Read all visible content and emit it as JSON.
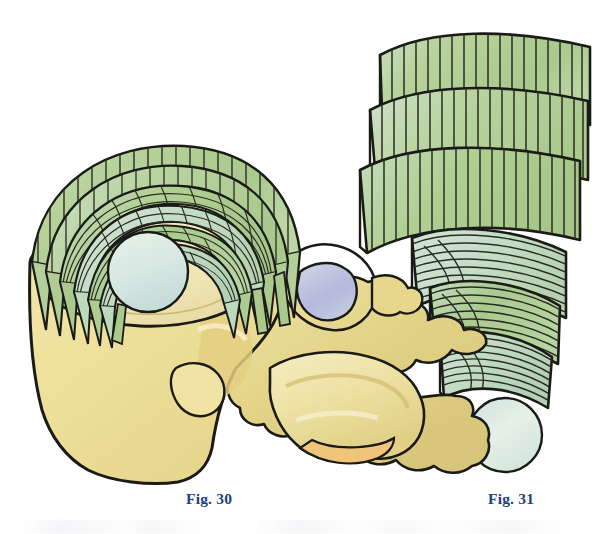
{
  "plate": {
    "background_color": "#ffffff",
    "width": 611,
    "height": 534,
    "subject": "intervertebral disc annulus fibrosus lamellae and vertebra"
  },
  "captions": {
    "fig30": "Fig. 30",
    "fig31": "Fig. 31",
    "color": "#1f3f7f"
  },
  "palette": {
    "outline": "#1a1a16",
    "lamella_green_light": "#c3d8a8",
    "lamella_green_mid": "#aecb92",
    "lamella_green_pale": "#cfe0c4",
    "lamella_green_blue": "#c2d9cf",
    "nucleus_fill_a": "#e2efe6",
    "nucleus_fill_b": "#cfe2de",
    "bone_cream": "#f2e7b4",
    "bone_yellow": "#eedc96",
    "bone_gold": "#ddc871",
    "bone_shadow": "#c9b56a",
    "bone_highlight": "#f8f1cf",
    "bone_orange": "#eec57a",
    "canal_blue": "#b9bfda"
  },
  "fig30": {
    "label": "Fig. 30",
    "description": "Vertebral body seen from above with the annulus fibrosus lamellae cut away to expose the nucleus pulposus",
    "parts": [
      {
        "name": "vertebral-body",
        "color": "#eedc96"
      },
      {
        "name": "vertebral-endplate",
        "color": "#f4ead0"
      },
      {
        "name": "annulus-lamellae",
        "count": 9,
        "color": "#aecb92"
      },
      {
        "name": "nucleus-pulposus",
        "color": "#dceae6"
      },
      {
        "name": "pedicle",
        "color": "#ddc871"
      },
      {
        "name": "vertebral-foramen",
        "color": "#b9bfda"
      },
      {
        "name": "transverse-process",
        "color": "#eedc96"
      },
      {
        "name": "superior-articular-process",
        "color": "#e9d98f"
      },
      {
        "name": "spinous-process",
        "color": "#f2e7b4"
      }
    ],
    "lamellae_count": 9
  },
  "fig31": {
    "label": "Fig. 31",
    "description": "Isolated stack of annulus fibrosus lamellae with alternating fibre orientation, and the nucleus pulposus below",
    "bands": [
      {
        "index": 1,
        "fibre_pattern": "vertical",
        "color": "#b6d195"
      },
      {
        "index": 2,
        "fibre_pattern": "vertical",
        "color": "#b9d39a"
      },
      {
        "index": 3,
        "fibre_pattern": "vertical",
        "color": "#aecb92"
      },
      {
        "index": 4,
        "fibre_pattern": "concentric-arcs",
        "color": "#cbe0cd"
      },
      {
        "index": 5,
        "fibre_pattern": "concentric-arcs",
        "color": "#b1cf9a"
      },
      {
        "index": 6,
        "fibre_pattern": "concentric-arcs",
        "color": "#c5dcc8"
      }
    ],
    "band_count": 6,
    "nucleus": {
      "name": "nucleus-pulposus",
      "color": "#d5e7e2",
      "radius": 36
    }
  }
}
